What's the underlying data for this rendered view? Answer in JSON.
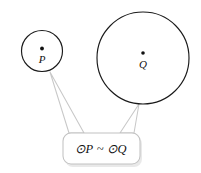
{
  "figure": {
    "background_color": "#ffffff",
    "circles": [
      {
        "id": "circle-p",
        "label": "P",
        "center_label_symbol": "center-dot",
        "cx": 42,
        "cy": 51,
        "r": 20.5,
        "stroke_color": "#1a1a1a",
        "fill_color": "#ffffff",
        "dot_x": 42,
        "dot_y": 49,
        "label_x": 42,
        "label_y": 63
      },
      {
        "id": "circle-q",
        "label": "Q",
        "center_label_symbol": "center-dot",
        "cx": 143,
        "cy": 58,
        "r": 46,
        "stroke_color": "#1a1a1a",
        "fill_color": "#ffffff",
        "dot_x": 143,
        "dot_y": 53,
        "label_x": 143,
        "label_y": 68
      }
    ],
    "callout": {
      "formula": "⊙P ~ ⊙Q",
      "formula_x": 101,
      "formula_y": 152,
      "box_x": 63,
      "box_y": 133,
      "box_width": 77,
      "box_height": 31,
      "box_radius": 8,
      "border_color": "#c2c2c2",
      "fill_color": "#ffffff",
      "shadow_color": "#e9e9e9",
      "tails": [
        {
          "id": "tail-to-circle-p",
          "target": "circle-p",
          "points": "50,72 84,133 69,133"
        },
        {
          "id": "tail-to-circle-q",
          "target": "circle-q",
          "points": "139,104 120,133 134,133"
        }
      ]
    }
  }
}
